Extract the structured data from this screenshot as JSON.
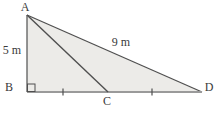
{
  "figure": {
    "type": "geometry-diagram",
    "labels": {
      "a": "A",
      "b": "B",
      "c": "C",
      "d": "D"
    },
    "measurements": {
      "ab": "5 m",
      "ad": "9 m"
    },
    "right_angle_at": "B",
    "equal_segments": [
      "BC",
      "CD"
    ],
    "colors": {
      "fill": "#ecebe8",
      "stroke": "#4f4f4f",
      "baseline": "#9a9a9a",
      "label": "#3a3a3a",
      "background": "#ffffff"
    }
  }
}
